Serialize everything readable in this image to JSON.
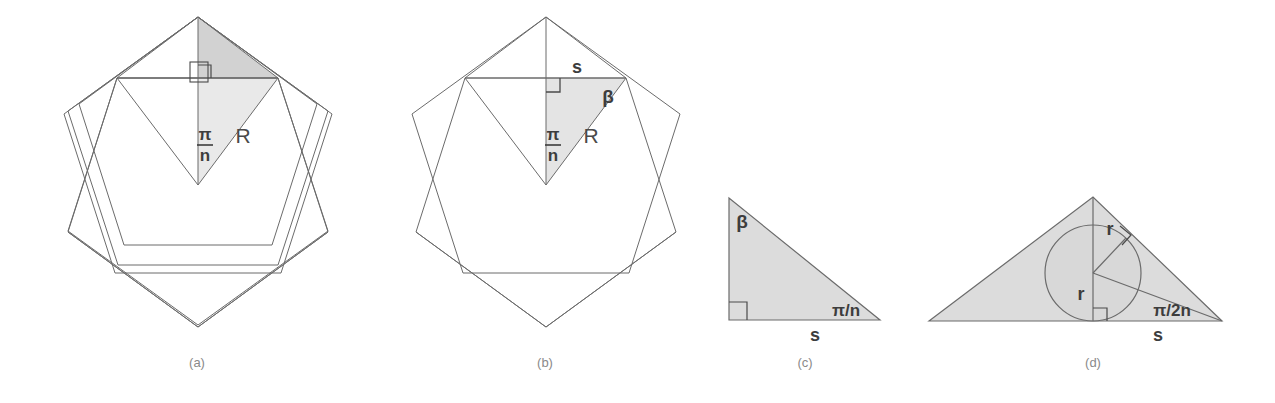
{
  "figure": {
    "background": "#ffffff",
    "stroke_color": "#6b6b6b",
    "shade_dark": "#d2d2d2",
    "shade_light": "#e9e9e9",
    "shade_mid": "#dcdcdc",
    "label_color": "#4a4a4a",
    "caption_color": "#8a8a8a"
  },
  "panels": [
    {
      "id": "a",
      "caption": "(a)",
      "caption_x": 197,
      "description": "Regular pentagon with inscribed rotated pentagon; shaded kite split into two right triangles from the center.",
      "labels": [
        {
          "name": "pi-over-n",
          "numerator": "π",
          "denominator": "n",
          "x": 205,
          "y": 140
        },
        {
          "name": "circumradius-R",
          "text": "R",
          "x": 243,
          "y": 137
        }
      ],
      "right_angle_marks": 1
    },
    {
      "id": "b",
      "caption": "(b)",
      "caption_x": 545,
      "description": "Same pentagon pair; only the lower right triangle is shaded, with side s, angle beta, angle pi/n and circumradius R labelled.",
      "labels": [
        {
          "name": "side-s",
          "text": "s",
          "x": 577,
          "y": 73
        },
        {
          "name": "angle-beta",
          "text": "β",
          "x": 608,
          "y": 97
        },
        {
          "name": "pi-over-n",
          "numerator": "π",
          "denominator": "n",
          "x": 552,
          "y": 140
        },
        {
          "name": "circumradius-R",
          "text": "R",
          "x": 590,
          "y": 137
        }
      ],
      "right_angle_marks": 1
    },
    {
      "id": "c",
      "caption": "(c)",
      "caption_x": 805,
      "description": "Isolated right triangle with angle beta at the top vertex, right angle at bottom left, angle pi/n at bottom right and base s.",
      "labels": [
        {
          "name": "angle-beta",
          "text": "β",
          "x": 742,
          "y": 222
        },
        {
          "name": "angle-pi-over-n",
          "text": "π/n",
          "x": 834,
          "y": 311
        },
        {
          "name": "base-s",
          "text": "s",
          "x": 815,
          "y": 337
        }
      ],
      "right_angle_marks": 1
    },
    {
      "id": "d",
      "caption": "(d)",
      "caption_x": 1093,
      "description": "Triangle with inscribed circle of radius r, vertical segment r, perpendicular r to the hypotenuse, angle pi/2n at the right vertex and base s.",
      "labels": [
        {
          "name": "inradius-r-upper",
          "text": "r",
          "x": 1113,
          "y": 228
        },
        {
          "name": "inradius-r-lower",
          "text": "r",
          "x": 1082,
          "y": 294
        },
        {
          "name": "angle-pi-over-2n",
          "text": "π/2n",
          "x": 1172,
          "y": 311
        },
        {
          "name": "base-s",
          "text": "s",
          "x": 1160,
          "y": 335
        }
      ],
      "right_angle_marks": 2
    }
  ]
}
